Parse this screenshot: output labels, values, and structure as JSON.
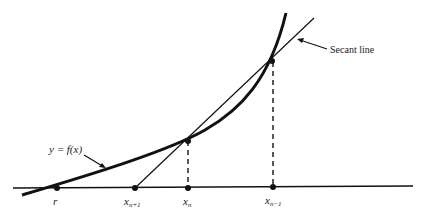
{
  "diagram": {
    "labels": {
      "curve": "y = f(x)",
      "secant": "Secant line",
      "root": "r",
      "x_next": "x",
      "x_next_sub": "n+1",
      "x_curr": "x",
      "x_curr_sub": "n",
      "x_prev": "x",
      "x_prev_sub": "n−1"
    },
    "points": {
      "root": {
        "x": 57,
        "y": 188
      },
      "x_next": {
        "x": 135,
        "y": 188
      },
      "x_curr": {
        "x": 188,
        "y": 188
      },
      "x_prev": {
        "x": 273,
        "y": 188
      },
      "f_x_curr": {
        "x": 188,
        "y": 141
      },
      "f_x_prev": {
        "x": 273,
        "y": 62
      }
    },
    "colors": {
      "stroke": "#111111",
      "background": "#ffffff"
    }
  }
}
